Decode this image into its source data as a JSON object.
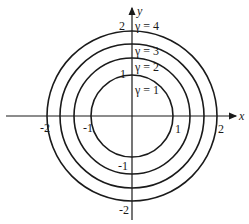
{
  "diagram": {
    "type": "concentric-circles",
    "axes": {
      "x_label": "x",
      "y_label": "y",
      "x_ticks": [
        "-2",
        "-1",
        "1",
        "2"
      ],
      "y_ticks": [
        "2",
        "1",
        "-1",
        "-2"
      ]
    },
    "circles": [
      {
        "label": "γ = 1",
        "radius_px": 41
      },
      {
        "label": "γ = 2",
        "radius_px": 58
      },
      {
        "label": "γ = 3",
        "radius_px": 72
      },
      {
        "label": "γ = 4",
        "radius_px": 85
      }
    ],
    "colors": {
      "stroke": "#1a1a1a",
      "background": "#ffffff"
    }
  }
}
